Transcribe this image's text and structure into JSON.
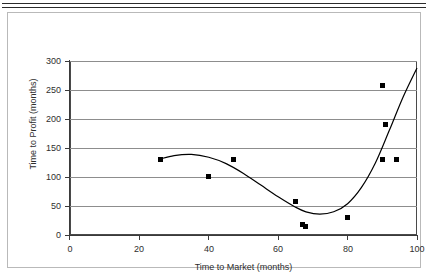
{
  "page": {
    "cut_off_text": "…………………………………………………………………………………………",
    "figure_border_color": "#b9b9b9"
  },
  "chart_data": {
    "type": "scatter",
    "title": "",
    "xlabel": "Time to Market (months)",
    "ylabel": "Time to Profit (months)",
    "xlim": [
      0,
      100
    ],
    "ylim": [
      0,
      300
    ],
    "xticks": [
      0,
      20,
      40,
      60,
      80,
      100
    ],
    "yticks": [
      0,
      50,
      100,
      150,
      200,
      250,
      300
    ],
    "grid": "horizontal",
    "legend": "none",
    "marker_color": "#000000",
    "marker_shape": "square",
    "trend_color": "#000000",
    "points": [
      {
        "x": 26,
        "y": 131
      },
      {
        "x": 40,
        "y": 101
      },
      {
        "x": 47,
        "y": 131
      },
      {
        "x": 65,
        "y": 57
      },
      {
        "x": 67,
        "y": 18
      },
      {
        "x": 68,
        "y": 14
      },
      {
        "x": 80,
        "y": 31
      },
      {
        "x": 90,
        "y": 258
      },
      {
        "x": 91,
        "y": 190
      },
      {
        "x": 90,
        "y": 130
      },
      {
        "x": 94,
        "y": 130
      }
    ],
    "trend": {
      "kind": "polynomial-fit",
      "x": [
        26,
        30,
        35,
        40,
        45,
        50,
        55,
        60,
        65,
        68,
        72,
        76,
        80,
        84,
        88,
        92,
        96,
        100
      ],
      "y": [
        131,
        137,
        139,
        134,
        123,
        106,
        86,
        66,
        48,
        40,
        36,
        40,
        54,
        82,
        124,
        180,
        238,
        288
      ]
    }
  },
  "axis_values": {
    "y": [
      "300",
      "250",
      "200",
      "150",
      "100",
      "50",
      "0"
    ],
    "x": [
      "0",
      "20",
      "40",
      "60",
      "80",
      "100"
    ]
  }
}
